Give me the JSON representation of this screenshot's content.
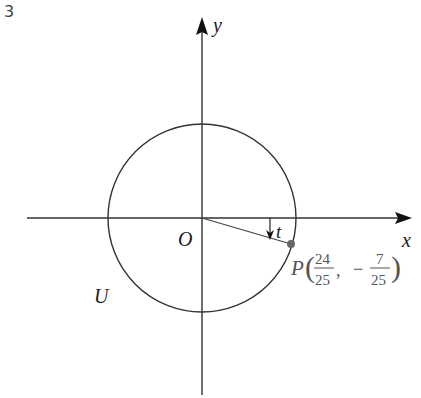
{
  "problem_number": "3",
  "diagram": {
    "axes": {
      "x_label": "x",
      "y_label": "y",
      "origin_label": "O"
    },
    "circle": {
      "label": "U",
      "description": "unit circle centered at origin"
    },
    "angle": {
      "label": "t",
      "direction": "clockwise"
    },
    "point": {
      "name": "P",
      "x_num": "24",
      "x_den": "25",
      "y_sign": "−",
      "y_num": "7",
      "y_den": "25",
      "comma": ","
    },
    "colors": {
      "line": "#222222",
      "point": "#666666",
      "point_label": "#555555"
    }
  }
}
